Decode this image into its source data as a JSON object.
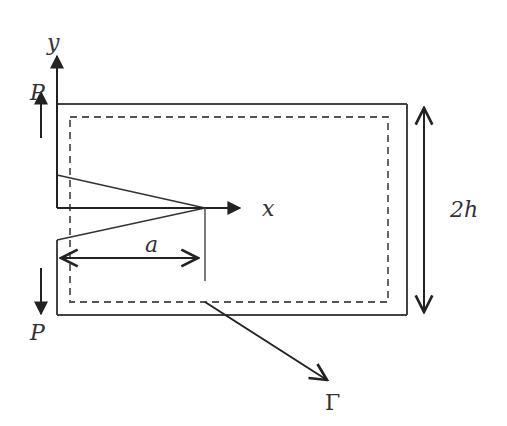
{
  "diagram": {
    "labels": {
      "y_axis": "y",
      "x_axis": "x",
      "load_top": "P",
      "load_bottom": "P",
      "crack_length": "a",
      "height": "2h",
      "contour": "Γ"
    },
    "colors": {
      "line": "#333333",
      "dashed": "#555555",
      "background": "#ffffff"
    }
  }
}
